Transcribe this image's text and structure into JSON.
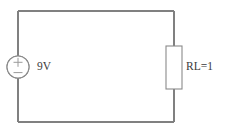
{
  "figure": {
    "background_color": "#ffffff",
    "line_color": "#808080",
    "text_color": "#3a3a3a",
    "width": 226,
    "height": 133
  },
  "components": {
    "source": {
      "name": "voltage-source",
      "label": "9V",
      "symbol_type": "circle",
      "polarity_top": "+",
      "polarity_bottom": "−",
      "center_x": 18,
      "center_y": 67,
      "radius": 11,
      "label_x": 37,
      "label_y": 67
    },
    "resistor": {
      "name": "load-resistor",
      "label": "RL=1",
      "symbol_type": "rectangle",
      "x": 166,
      "y": 46,
      "width": 16,
      "height": 43,
      "label_x": 186,
      "label_y": 67
    }
  },
  "wires": {
    "top": "M 18 11 L 174 11",
    "bottom": "M 18 122 L 174 122",
    "left_upper": "M 18 11 L 18 56",
    "left_lower": "M 18 78 L 18 122",
    "right_upper": "M 174 11 L 174 46",
    "right_lower": "M 174 89 L 174 122"
  },
  "loop": {
    "left_x": 18,
    "right_x": 174,
    "top_y": 11,
    "bottom_y": 122
  }
}
